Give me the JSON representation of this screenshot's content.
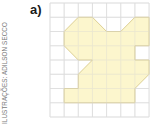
{
  "label": "a)",
  "credit": "ILUSTRAÇÕES: ADILSON SECCO",
  "grid": {
    "columns": 7,
    "rows": 8,
    "origin_px": [
      50,
      3
    ],
    "cell_px": [
      14.15,
      14.25
    ],
    "line_color": "#dcdcdc"
  },
  "figure": {
    "fill": "#fbf4c4",
    "stroke": "#d8c98a",
    "vertices_grid_units": [
      [
        2,
        1
      ],
      [
        3,
        1
      ],
      [
        4,
        2
      ],
      [
        5,
        2
      ],
      [
        6,
        1
      ],
      [
        7,
        1
      ],
      [
        7,
        3
      ],
      [
        6,
        3
      ],
      [
        6,
        4
      ],
      [
        7,
        4
      ],
      [
        7,
        5
      ],
      [
        6,
        6
      ],
      [
        6,
        7
      ],
      [
        1,
        7
      ],
      [
        1,
        6
      ],
      [
        2,
        6
      ],
      [
        2,
        5
      ],
      [
        3,
        4
      ],
      [
        2,
        4
      ],
      [
        1,
        3
      ],
      [
        1,
        2
      ]
    ]
  }
}
